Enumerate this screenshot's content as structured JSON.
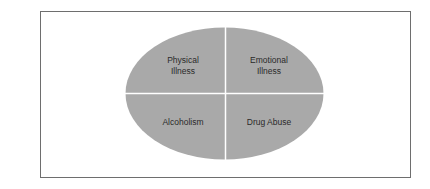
{
  "diagram": {
    "type": "quadrant-ellipse",
    "fill_color": "#a9a9a9",
    "divider_color": "#ffffff",
    "border_color": "#6e6e6e",
    "quadrants": [
      {
        "position": "top-left",
        "line1": "Physical",
        "line2": "Illness"
      },
      {
        "position": "top-right",
        "line1": "Emotional",
        "line2": "Illness"
      },
      {
        "position": "bottom-left",
        "line1": "Alcoholism",
        "line2": ""
      },
      {
        "position": "bottom-right",
        "line1": "Drug Abuse",
        "line2": ""
      }
    ]
  }
}
